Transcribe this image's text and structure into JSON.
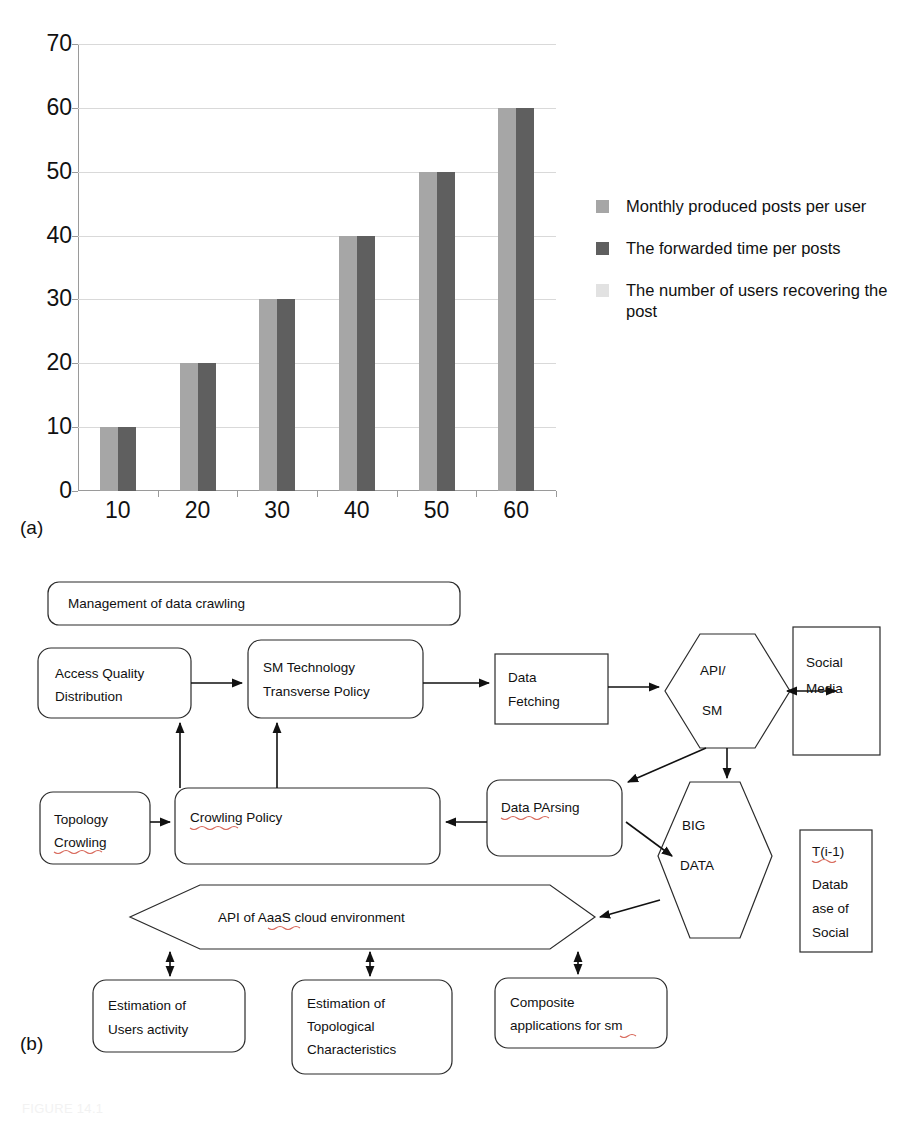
{
  "figure": {
    "panel_a_label": "(a)",
    "panel_b_label": "(b)",
    "bottom_caption": "FIGURE 14.1"
  },
  "chart_data": {
    "type": "bar",
    "title": "",
    "xlabel": "",
    "ylabel": "",
    "categories": [
      "10",
      "20",
      "30",
      "40",
      "50",
      "60"
    ],
    "series": [
      {
        "name": "Monthly produced posts per user",
        "values": [
          10,
          20,
          30,
          40,
          50,
          60
        ],
        "color": "#a6a6a6"
      },
      {
        "name": "The forwarded time per posts",
        "values": [
          10,
          20,
          30,
          40,
          50,
          60
        ],
        "color": "#5f5f5f"
      },
      {
        "name": "The number of users recovering the post",
        "values": [
          0,
          0,
          0,
          0,
          0,
          0
        ],
        "color": "#e2e2e2"
      }
    ],
    "ylim": [
      0,
      70
    ],
    "yticks": [
      0,
      10,
      20,
      30,
      40,
      50,
      60,
      70
    ],
    "ytick_labels": [
      "0",
      "10",
      "20",
      "30",
      "40",
      "50",
      "60",
      "70"
    ],
    "grid": true,
    "legend_position": "right"
  },
  "legend": {
    "items": [
      {
        "label": "Monthly produced posts per user",
        "color": "#a6a6a6"
      },
      {
        "label": "The forwarded time per posts",
        "color": "#5f5f5f"
      },
      {
        "label": "The number of users recovering the post",
        "color": "#e2e2e2"
      }
    ]
  },
  "diagram": {
    "nodes": {
      "management": "Management of data crawling",
      "access_quality_l1": "Access Quality",
      "access_quality_l2": "Distribution",
      "sm_tech_l1": "SM Technology",
      "sm_tech_l2": "Transverse Policy",
      "data_fetching_l1": "Data",
      "data_fetching_l2": "Fetching",
      "api_sm_l1": "API/",
      "api_sm_l2": "SM",
      "social_media_l1": "Social",
      "social_media_l2": "Media",
      "topology_l1": "Topology",
      "topology_l2": "Crowling",
      "crowling_policy": "Crowling Policy",
      "data_parsing": "Data PArsing",
      "big_data_l1": "BIG",
      "big_data_l2": "DATA",
      "tdb_l1": "T(i-1)",
      "tdb_l2": "Datab",
      "tdb_l3": "ase of",
      "tdb_l4": "Social",
      "aaas_api": "API of AaaS cloud environment",
      "est_users_l1": "Estimation of",
      "est_users_l2": "Users activity",
      "est_topo_l1": "Estimation of",
      "est_topo_l2": "Topological",
      "est_topo_l3": "Characteristics",
      "composite_l1": "Composite",
      "composite_l2": "applications for sm"
    }
  }
}
